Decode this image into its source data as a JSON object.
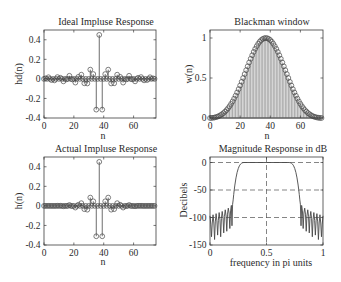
{
  "figure": {
    "background": "#ffffff",
    "axis_color": "#3c3c3c",
    "data_color": "#474747",
    "stem_fill_color": "#8c8c8c",
    "grid_color": "#505050",
    "text_color": "#2a2a2a"
  },
  "chart_data": [
    {
      "id": "ideal-impulse-response",
      "type": "stem",
      "title": "Ideal Impluse Response",
      "xlabel": "n",
      "ylabel": "hd(n)",
      "xlim": [
        0,
        75
      ],
      "ylim": [
        -0.4,
        0.5
      ],
      "xticks": [
        0,
        20,
        40,
        60
      ],
      "xtick_labels": [
        "0",
        "20",
        "40",
        "60"
      ],
      "yticks": [
        -0.4,
        -0.2,
        0,
        0.2,
        0.4
      ],
      "ytick_labels": [
        "-0.4",
        "-0.2",
        "0",
        "0.2",
        "0.4"
      ],
      "grid": false,
      "marker": "circle",
      "x": [
        0,
        1,
        2,
        3,
        4,
        5,
        6,
        7,
        8,
        9,
        10,
        11,
        12,
        13,
        14,
        15,
        16,
        17,
        18,
        19,
        20,
        21,
        22,
        23,
        24,
        25,
        26,
        27,
        28,
        29,
        30,
        31,
        32,
        33,
        34,
        35,
        36,
        37,
        38,
        39,
        40,
        41,
        42,
        43,
        44,
        45,
        46,
        47,
        48,
        49,
        50,
        51,
        52,
        53,
        54,
        55,
        56,
        57,
        58,
        59,
        60,
        61,
        62,
        63,
        64,
        65,
        66,
        67,
        68,
        69,
        70,
        71,
        72,
        73,
        74
      ],
      "values": [
        0,
        0.0055,
        0,
        0.0167,
        0,
        -0.0117,
        0,
        -0.015,
        0,
        0.0184,
        0,
        0.0111,
        0,
        -0.0252,
        0,
        -0.0045,
        0,
        0.0318,
        0,
        -0.0055,
        0,
        -0.0378,
        0,
        0.0206,
        0,
        0.0429,
        0,
        -0.045,
        0,
        -0.0468,
        0,
        0.0945,
        0,
        0.0492,
        0,
        -0.3144,
        0,
        0.45,
        0,
        -0.3144,
        0,
        0.0492,
        0,
        0.0945,
        0,
        -0.0468,
        0,
        -0.045,
        0,
        0.0429,
        0,
        0.0206,
        0,
        -0.0378,
        0,
        -0.0055,
        0,
        0.0318,
        0,
        -0.0045,
        0,
        -0.0252,
        0,
        0.0111,
        0,
        0.0184,
        0,
        -0.015,
        0,
        -0.0117,
        0,
        0.0167,
        0,
        0.0055,
        0
      ]
    },
    {
      "id": "blackman-window",
      "type": "stem",
      "title": "Blackman window",
      "xlabel": "n",
      "ylabel": "w(n)",
      "xlim": [
        0,
        75
      ],
      "ylim": [
        0,
        1.1
      ],
      "xticks": [
        0,
        20,
        40,
        60
      ],
      "xtick_labels": [
        "0",
        "20",
        "40",
        "60"
      ],
      "yticks": [
        0,
        0.5,
        1
      ],
      "ytick_labels": [
        "0",
        "0.5",
        "1"
      ],
      "grid": false,
      "marker": "circle",
      "x": [
        0,
        1,
        2,
        3,
        4,
        5,
        6,
        7,
        8,
        9,
        10,
        11,
        12,
        13,
        14,
        15,
        16,
        17,
        18,
        19,
        20,
        21,
        22,
        23,
        24,
        25,
        26,
        27,
        28,
        29,
        30,
        31,
        32,
        33,
        34,
        35,
        36,
        37,
        38,
        39,
        40,
        41,
        42,
        43,
        44,
        45,
        46,
        47,
        48,
        49,
        50,
        51,
        52,
        53,
        54,
        55,
        56,
        57,
        58,
        59,
        60,
        61,
        62,
        63,
        64,
        65,
        66,
        67,
        68,
        69,
        70,
        71,
        72,
        73,
        74
      ],
      "values": [
        0,
        0.001,
        0.003,
        0.006,
        0.011,
        0.017,
        0.025,
        0.036,
        0.048,
        0.062,
        0.08,
        0.099,
        0.122,
        0.147,
        0.176,
        0.207,
        0.242,
        0.279,
        0.319,
        0.361,
        0.406,
        0.452,
        0.5,
        0.549,
        0.598,
        0.646,
        0.694,
        0.74,
        0.784,
        0.826,
        0.864,
        0.898,
        0.928,
        0.954,
        0.974,
        0.988,
        0.997,
        1.0,
        0.997,
        0.988,
        0.974,
        0.954,
        0.928,
        0.898,
        0.864,
        0.826,
        0.784,
        0.74,
        0.694,
        0.646,
        0.598,
        0.549,
        0.5,
        0.452,
        0.406,
        0.361,
        0.319,
        0.279,
        0.242,
        0.207,
        0.176,
        0.147,
        0.122,
        0.099,
        0.08,
        0.062,
        0.048,
        0.036,
        0.025,
        0.017,
        0.011,
        0.006,
        0.003,
        0.001,
        0
      ]
    },
    {
      "id": "actual-impulse-response",
      "type": "stem",
      "title": "Actual Impluse Response",
      "xlabel": "n",
      "ylabel": "h(n)",
      "xlim": [
        0,
        75
      ],
      "ylim": [
        -0.4,
        0.5
      ],
      "xticks": [
        0,
        20,
        40,
        60
      ],
      "xtick_labels": [
        "0",
        "20",
        "40",
        "60"
      ],
      "yticks": [
        -0.4,
        -0.2,
        0,
        0.2,
        0.4
      ],
      "ytick_labels": [
        "-0.4",
        "-0.2",
        "0",
        "0.2",
        "0.4"
      ],
      "grid": false,
      "marker": "circle",
      "x": [
        0,
        1,
        2,
        3,
        4,
        5,
        6,
        7,
        8,
        9,
        10,
        11,
        12,
        13,
        14,
        15,
        16,
        17,
        18,
        19,
        20,
        21,
        22,
        23,
        24,
        25,
        26,
        27,
        28,
        29,
        30,
        31,
        32,
        33,
        34,
        35,
        36,
        37,
        38,
        39,
        40,
        41,
        42,
        43,
        44,
        45,
        46,
        47,
        48,
        49,
        50,
        51,
        52,
        53,
        54,
        55,
        56,
        57,
        58,
        59,
        60,
        61,
        62,
        63,
        64,
        65,
        66,
        67,
        68,
        69,
        70,
        71,
        72,
        73,
        74
      ],
      "values": [
        0,
        0,
        0,
        0.0001,
        0,
        -0.0002,
        0,
        -0.0005,
        0,
        0.0011,
        0,
        0.0011,
        0,
        -0.0037,
        0,
        -0.0009,
        0,
        0.0089,
        0,
        -0.002,
        0,
        -0.0171,
        0,
        0.0113,
        0,
        0.0277,
        0,
        -0.0333,
        0,
        -0.0387,
        0,
        0.0849,
        0,
        0.0469,
        0,
        -0.3106,
        0,
        0.45,
        0,
        -0.3106,
        0,
        0.0469,
        0,
        0.0849,
        0,
        -0.0387,
        0,
        -0.0333,
        0,
        0.0277,
        0,
        0.0113,
        0,
        -0.0171,
        0,
        -0.002,
        0,
        0.0089,
        0,
        -0.0009,
        0,
        -0.0037,
        0,
        0.0011,
        0,
        0.0011,
        0,
        -0.0005,
        0,
        -0.0002,
        0,
        0.0001,
        0,
        0,
        0
      ]
    },
    {
      "id": "magnitude-response-db",
      "type": "line",
      "title": "Magnitude Response in dB",
      "xlabel": "frequency in pi units",
      "ylabel": "Decibels",
      "xlim": [
        0,
        1
      ],
      "ylim": [
        -150,
        10
      ],
      "xticks": [
        0,
        0.5,
        1
      ],
      "xtick_labels": [
        "0",
        "0.5",
        "1"
      ],
      "yticks": [
        -150,
        -100,
        -50,
        0
      ],
      "ytick_labels": [
        "-150",
        "-100",
        "-50",
        "0"
      ],
      "grid": true,
      "grid_x": [
        0.5
      ],
      "grid_y": [
        -100,
        -50,
        0
      ],
      "x": [
        0,
        0.007,
        0.0135,
        0.02,
        0.027,
        0.034,
        0.0405,
        0.047,
        0.054,
        0.061,
        0.0675,
        0.074,
        0.081,
        0.088,
        0.0945,
        0.101,
        0.108,
        0.115,
        0.1215,
        0.128,
        0.135,
        0.142,
        0.1485,
        0.155,
        0.162,
        0.169,
        0.1755,
        0.182,
        0.189,
        0.1945,
        0.2,
        0.205,
        0.21,
        0.215,
        0.22,
        0.23,
        0.24,
        0.25,
        0.26,
        0.27,
        0.28,
        0.29,
        0.3,
        0.5,
        0.7,
        0.71,
        0.72,
        0.73,
        0.74,
        0.75,
        0.76,
        0.77,
        0.78,
        0.785,
        0.79,
        0.795,
        0.8,
        0.8055,
        0.811,
        0.818,
        0.8245,
        0.831,
        0.838,
        0.845,
        0.8515,
        0.858,
        0.865,
        0.872,
        0.8785,
        0.885,
        0.892,
        0.899,
        0.9055,
        0.912,
        0.919,
        0.926,
        0.9325,
        0.939,
        0.946,
        0.953,
        0.9595,
        0.966,
        0.973,
        0.98,
        0.9865,
        0.993,
        1.0
      ],
      "values": [
        -97,
        -112,
        -135,
        -110,
        -95,
        -110,
        -140,
        -108,
        -93,
        -106,
        -132,
        -105,
        -91,
        -104,
        -135,
        -102,
        -89,
        -100,
        -128,
        -98,
        -86,
        -97,
        -125,
        -94,
        -83,
        -92,
        -120,
        -88,
        -78,
        -115,
        -76,
        -68,
        -58,
        -49,
        -41,
        -28,
        -18,
        -11,
        -6,
        -3,
        -1.2,
        -0.3,
        0,
        0,
        0,
        -0.3,
        -1.2,
        -3,
        -6,
        -11,
        -18,
        -28,
        -41,
        -49,
        -58,
        -68,
        -76,
        -115,
        -78,
        -88,
        -120,
        -92,
        -83,
        -94,
        -125,
        -97,
        -86,
        -98,
        -128,
        -100,
        -89,
        -102,
        -135,
        -104,
        -91,
        -105,
        -132,
        -106,
        -93,
        -108,
        -140,
        -110,
        -95,
        -110,
        -135,
        -112,
        -97
      ]
    }
  ]
}
